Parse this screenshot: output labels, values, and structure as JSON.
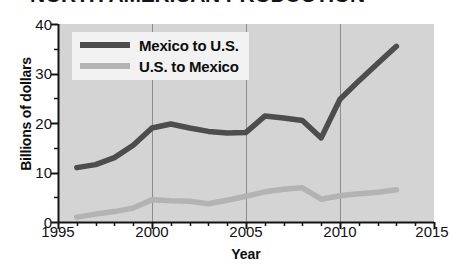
{
  "title": "NORTH AMERICAN PRODUCTION",
  "axes": {
    "ylabel": "Billions of dollars",
    "xlabel": "Year"
  },
  "legend": {
    "items": [
      {
        "label": "Mexico to U.S.",
        "color": "#4d4d4d"
      },
      {
        "label": "U.S. to Mexico",
        "color": "#b3b3b3"
      }
    ]
  },
  "ticks": {
    "y": [
      "40",
      "30",
      "20",
      "10",
      "0"
    ],
    "x": [
      "1995",
      "2000",
      "2005",
      "2010",
      "2015"
    ]
  },
  "colors": {
    "plot_background": "#d4d4d4",
    "gridline": "#8c8c8c",
    "axis": "#141414",
    "series_dark": "#4d4d4d",
    "series_light": "#b3b3b3",
    "legend_background": "#f2f2f2"
  },
  "chart_data": {
    "type": "line",
    "title": "NORTH AMERICAN PRODUCTION",
    "xlabel": "Year",
    "ylabel": "Billions of dollars",
    "xlim": [
      1995,
      2015
    ],
    "ylim": [
      0,
      40
    ],
    "xticks": [
      1995,
      2000,
      2005,
      2010,
      2015
    ],
    "yticks": [
      0,
      10,
      20,
      30,
      40
    ],
    "xminor_step": 1,
    "yminor_step": 5,
    "grid": "vertical-major-only",
    "legend_position": "upper-left-inside",
    "x": [
      1996,
      1997,
      1998,
      1999,
      2000,
      2001,
      2002,
      2003,
      2004,
      2005,
      2006,
      2007,
      2008,
      2009,
      2010,
      2011,
      2012,
      2013
    ],
    "series": [
      {
        "name": "Mexico to U.S.",
        "color": "#4d4d4d",
        "values": [
          11.0,
          11.6,
          13.0,
          15.5,
          19.0,
          19.8,
          19.0,
          18.3,
          18.0,
          18.1,
          21.4,
          21.0,
          20.5,
          17.0,
          24.8,
          28.5,
          32.0,
          35.5
        ]
      },
      {
        "name": "U.S. to Mexico",
        "color": "#b3b3b3",
        "values": [
          1.0,
          1.6,
          2.1,
          2.8,
          4.5,
          4.3,
          4.2,
          3.7,
          4.4,
          5.2,
          6.1,
          6.6,
          6.9,
          4.6,
          5.3,
          5.7,
          6.0,
          6.5
        ]
      }
    ]
  }
}
